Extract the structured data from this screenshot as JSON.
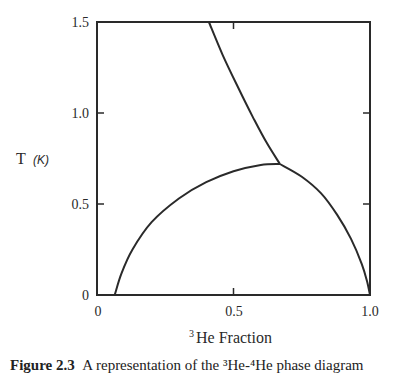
{
  "chart_data": {
    "type": "line",
    "title": "",
    "xlabel": "³He Fraction",
    "xlabel_parts": {
      "sup": "3",
      "text": "He Fraction"
    },
    "ylabel": "T (K)",
    "ylabel_parts": {
      "symbol": "T",
      "unit": "(K)"
    },
    "xlim": [
      0,
      1.0
    ],
    "ylim": [
      0,
      1.5
    ],
    "grid": false,
    "legend": null,
    "x_ticks": [
      {
        "value": 0,
        "label": "0"
      },
      {
        "value": 0.5,
        "label": "0.5"
      },
      {
        "value": 1.0,
        "label": "1.0"
      }
    ],
    "y_ticks": [
      {
        "value": 0,
        "label": "0"
      },
      {
        "value": 0.5,
        "label": "0.5"
      },
      {
        "value": 1.0,
        "label": "1.0"
      },
      {
        "value": 1.5,
        "label": "1.5"
      }
    ],
    "series": [
      {
        "name": "lambda line",
        "points": [
          [
            0.41,
            1.5
          ],
          [
            0.46,
            1.32
          ],
          [
            0.52,
            1.13
          ],
          [
            0.57,
            0.98
          ],
          [
            0.62,
            0.84
          ],
          [
            0.67,
            0.72
          ]
        ]
      },
      {
        "name": "phase separation boundary",
        "points": [
          [
            0.065,
            0.0
          ],
          [
            0.09,
            0.12
          ],
          [
            0.13,
            0.25
          ],
          [
            0.2,
            0.4
          ],
          [
            0.3,
            0.53
          ],
          [
            0.4,
            0.62
          ],
          [
            0.5,
            0.68
          ],
          [
            0.6,
            0.715
          ],
          [
            0.67,
            0.72
          ],
          [
            0.75,
            0.65
          ],
          [
            0.82,
            0.56
          ],
          [
            0.88,
            0.44
          ],
          [
            0.93,
            0.31
          ],
          [
            0.97,
            0.17
          ],
          [
            0.99,
            0.07
          ],
          [
            1.0,
            0.0
          ]
        ]
      }
    ],
    "annotations": [
      {
        "text": "tricritical point (junction)",
        "x": 0.67,
        "y": 0.72
      }
    ]
  },
  "caption": {
    "label": "Figure 2.3",
    "text": "A representation of the ³He-⁴He phase diagram"
  }
}
